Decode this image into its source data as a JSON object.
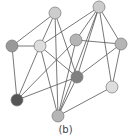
{
  "caption": "(b)",
  "colors": {
    "edge": "#555555",
    "stroke": "#777777"
  },
  "nodes": [
    {
      "id": "A",
      "x": 55,
      "y": 13,
      "fill": "#cccccc"
    },
    {
      "id": "B",
      "x": 99,
      "y": 7,
      "fill": "#cccccc"
    },
    {
      "id": "C",
      "x": 12,
      "y": 46,
      "fill": "#999999"
    },
    {
      "id": "D",
      "x": 40,
      "y": 46,
      "fill": "#dddddd"
    },
    {
      "id": "E",
      "x": 76,
      "y": 40,
      "fill": "#b5b5b5"
    },
    {
      "id": "F",
      "x": 121,
      "y": 44,
      "fill": "#b5b5b5"
    },
    {
      "id": "G",
      "x": 77,
      "y": 77,
      "fill": "#808080"
    },
    {
      "id": "H",
      "x": 112,
      "y": 87,
      "fill": "#dddddd"
    },
    {
      "id": "I",
      "x": 17,
      "y": 100,
      "fill": "#555555"
    },
    {
      "id": "J",
      "x": 58,
      "y": 116,
      "fill": "#b5b5b5"
    }
  ],
  "edges": [
    [
      "A",
      "C"
    ],
    [
      "A",
      "D"
    ],
    [
      "A",
      "G"
    ],
    [
      "A",
      "J"
    ],
    [
      "B",
      "D"
    ],
    [
      "B",
      "E"
    ],
    [
      "B",
      "F"
    ],
    [
      "B",
      "G"
    ],
    [
      "B",
      "H"
    ],
    [
      "B",
      "J"
    ],
    [
      "C",
      "D"
    ],
    [
      "C",
      "I"
    ],
    [
      "D",
      "I"
    ],
    [
      "D",
      "G"
    ],
    [
      "D",
      "J"
    ],
    [
      "E",
      "F"
    ],
    [
      "E",
      "I"
    ],
    [
      "E",
      "J"
    ],
    [
      "F",
      "G"
    ],
    [
      "F",
      "H"
    ],
    [
      "G",
      "I"
    ],
    [
      "G",
      "J"
    ],
    [
      "H",
      "J"
    ]
  ]
}
